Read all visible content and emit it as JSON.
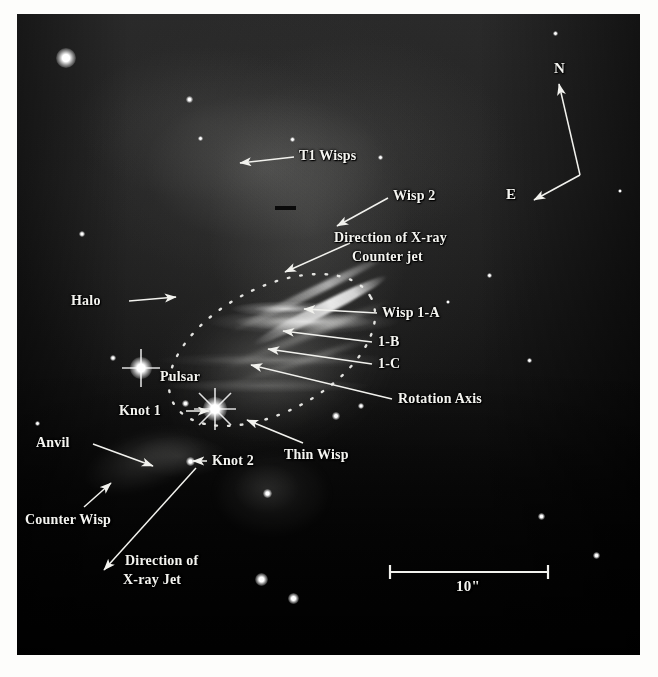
{
  "figure": {
    "background_color": "#ffffff",
    "plate_color": "#000000",
    "label_color": "#f4f4f0"
  },
  "compass": {
    "north_label": "N",
    "east_label": "E"
  },
  "scale_bar": {
    "label": "10\"",
    "length_arcsec": 10
  },
  "annotations": [
    {
      "id": "t1-wisps",
      "label": "T1 Wisps",
      "lines": [
        "T1 Wisps"
      ]
    },
    {
      "id": "wisp-2",
      "label": "Wisp 2",
      "lines": [
        "Wisp 2"
      ]
    },
    {
      "id": "counter-jet",
      "label": "Direction of X-ray Counter jet",
      "lines": [
        "Direction of X-ray",
        "Counter jet"
      ]
    },
    {
      "id": "wisp-1a",
      "label": "Wisp 1-A",
      "lines": [
        "Wisp 1-A"
      ]
    },
    {
      "id": "wisp-1b",
      "label": "1-B",
      "lines": [
        "1-B"
      ]
    },
    {
      "id": "wisp-1c",
      "label": "1-C",
      "lines": [
        "1-C"
      ]
    },
    {
      "id": "rotation-axis",
      "label": "Rotation Axis",
      "lines": [
        "Rotation Axis"
      ]
    },
    {
      "id": "halo",
      "label": "Halo",
      "lines": [
        "Halo"
      ]
    },
    {
      "id": "pulsar",
      "label": "Pulsar",
      "lines": [
        "Pulsar"
      ]
    },
    {
      "id": "knot-1",
      "label": "Knot 1",
      "lines": [
        "Knot 1"
      ]
    },
    {
      "id": "knot-2",
      "label": "Knot 2",
      "lines": [
        "Knot 2"
      ]
    },
    {
      "id": "thin-wisp",
      "label": "Thin Wisp",
      "lines": [
        "Thin Wisp"
      ]
    },
    {
      "id": "anvil",
      "label": "Anvil",
      "lines": [
        "Anvil"
      ]
    },
    {
      "id": "counter-wisp",
      "label": "Counter Wisp",
      "lines": [
        "Counter Wisp"
      ]
    },
    {
      "id": "x-ray-jet",
      "label": "Direction of X-ray Jet",
      "lines": [
        "Direction of",
        "X-ray Jet"
      ]
    }
  ],
  "labels": {
    "t1_wisps": "T1 Wisps",
    "wisp_2": "Wisp 2",
    "counter_jet_line1": "Direction of X-ray",
    "counter_jet_line2": "Counter jet",
    "wisp_1a": "Wisp 1-A",
    "wisp_1b": "1-B",
    "wisp_1c": "1-C",
    "rotation_axis": "Rotation Axis",
    "halo": "Halo",
    "pulsar": "Pulsar",
    "knot_1": "Knot 1",
    "knot_2": "Knot 2",
    "thin_wisp": "Thin Wisp",
    "anvil": "Anvil",
    "counter_wisp": "Counter Wisp",
    "jet_line1": "Direction of",
    "jet_line2": "X-ray Jet",
    "north": "N",
    "east": "E",
    "scale": "10\""
  }
}
